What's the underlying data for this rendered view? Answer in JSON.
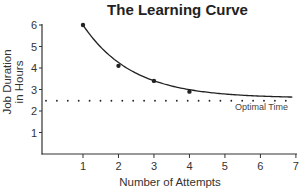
{
  "chart_data": {
    "type": "line",
    "title": "The Learning Curve",
    "xlabel": "Number of Attempts",
    "ylabel": "Job Duration in Hours",
    "ylabel_lines": [
      "Job Duration",
      "in Hours"
    ],
    "x_ticks": [
      1,
      2,
      3,
      4,
      5,
      6,
      7
    ],
    "y_ticks": [
      1,
      2,
      3,
      4,
      5,
      6
    ],
    "xlim": [
      0,
      7
    ],
    "ylim": [
      0,
      6
    ],
    "grid": false,
    "series": [
      {
        "name": "Learning curve",
        "x": [
          1,
          2,
          3,
          4
        ],
        "values": [
          6.0,
          4.1,
          3.4,
          2.9
        ],
        "style": "markers with smooth fitted curve",
        "curve_asymptote": 2.6
      }
    ],
    "reference_lines": [
      {
        "label": "Optimal Time",
        "y": 2.5,
        "style": "dotted"
      }
    ],
    "annotations": [
      {
        "text": "Optimal Time",
        "x": 6.0,
        "y": 2.1
      }
    ]
  },
  "colors": {
    "line": "#222222",
    "axis": "#333333",
    "text": "#222222"
  }
}
